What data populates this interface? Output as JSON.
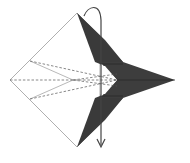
{
  "diagram": {
    "kind": "origami-fold-step",
    "colors": {
      "paper_front": "#ffffff",
      "paper_back": "#3d3d3d",
      "outline": "#9a9a9a",
      "crease": "#555555",
      "arrow": "#444444"
    },
    "elements": [
      {
        "name": "white-left-half",
        "type": "paper-face"
      },
      {
        "name": "dark-upper-flap",
        "type": "paper-back"
      },
      {
        "name": "dark-lower-flap",
        "type": "paper-back"
      },
      {
        "name": "dark-right-point",
        "type": "paper-back"
      },
      {
        "name": "valley-fold-lines",
        "type": "dashed-creases",
        "count": 5
      },
      {
        "name": "fold-over-arrow",
        "type": "arrow",
        "direction": "fold top to bottom"
      }
    ]
  }
}
